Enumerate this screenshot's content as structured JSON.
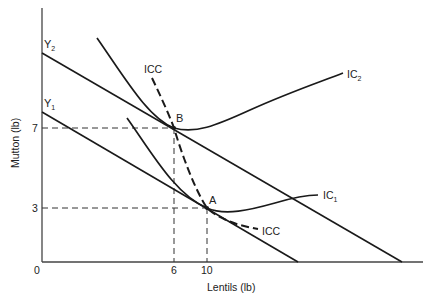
{
  "diagram": {
    "title": "",
    "axes": {
      "x_label": "Lentils (lb)",
      "y_label": "Mutton (lb)",
      "origin_label": "0",
      "x_ticks": [
        "6",
        "10"
      ],
      "y_ticks": [
        "7",
        "3"
      ]
    },
    "budget_lines": [
      {
        "name": "Y2",
        "label_main": "Y",
        "label_sub": "2"
      },
      {
        "name": "Y1",
        "label_main": "Y",
        "label_sub": "1"
      }
    ],
    "indifference_curves": [
      {
        "name": "IC2",
        "label_main": "IC",
        "label_sub": "2"
      },
      {
        "name": "IC1",
        "label_main": "IC",
        "label_sub": "1"
      }
    ],
    "icc": {
      "label_top": "ICC",
      "label_bottom": "ICC"
    },
    "points": [
      {
        "name": "B",
        "label": "B",
        "lentils": 6,
        "mutton": 7
      },
      {
        "name": "A",
        "label": "A",
        "lentils": 10,
        "mutton": 3
      }
    ],
    "colors": {
      "line": "#1a1a1a",
      "axis": "#555555",
      "text": "#222222"
    }
  }
}
